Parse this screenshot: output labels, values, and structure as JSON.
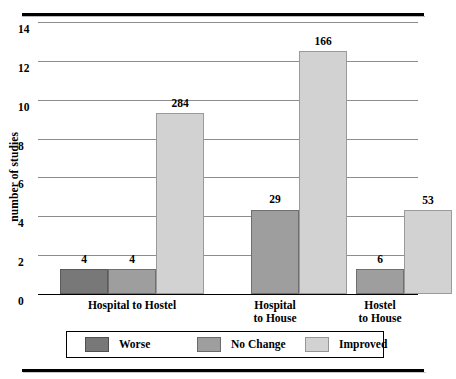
{
  "chart_data": {
    "type": "bar",
    "title": "",
    "xlabel": "",
    "ylabel": "number of studies",
    "ylim": [
      0,
      14
    ],
    "ytick_labels": [
      "0",
      "2",
      "4",
      "6",
      "8",
      "10",
      "12",
      "14"
    ],
    "ytick_values": [
      0,
      2,
      4,
      6,
      8,
      10,
      12,
      14
    ],
    "grid": true,
    "legend_position": "bottom",
    "categories": [
      "Hospital to Hostel",
      "Hospital to House",
      "Hostel to House"
    ],
    "category_lines": [
      [
        "Hospital to Hostel"
      ],
      [
        "Hospital",
        "to House"
      ],
      [
        "Hostel",
        "to House"
      ]
    ],
    "series": [
      {
        "name": "Worse",
        "color": "#787878",
        "values": [
          1.3,
          0,
          0
        ],
        "point_labels": [
          "4",
          "",
          ""
        ]
      },
      {
        "name": "No Change",
        "color": "#9e9e9e",
        "values": [
          1.3,
          4.35,
          1.3
        ],
        "point_labels": [
          "4",
          "29",
          "6"
        ]
      },
      {
        "name": "Improved",
        "color": "#d2d2d2",
        "values": [
          9.3,
          12.5,
          4.3
        ],
        "point_labels": [
          "284",
          "166",
          "53"
        ]
      }
    ]
  },
  "legend": {
    "items": [
      {
        "label": "Worse",
        "swatch": "worse"
      },
      {
        "label": "No Change",
        "swatch": "nochange"
      },
      {
        "label": "Improved",
        "swatch": "improved"
      }
    ]
  }
}
